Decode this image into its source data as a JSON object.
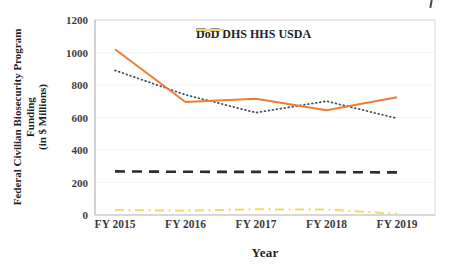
{
  "page": {
    "background": "#ffffff"
  },
  "chart_data": {
    "type": "line",
    "title": "",
    "xlabel": "Year",
    "ylabel": "Federal Civilian Biosecurity Program Funding (in $ Millions)",
    "ylabel_lines": [
      "Federal Civilian Biosecurity Program",
      "Funding",
      "(in $ Millions)"
    ],
    "categories": [
      "FY 2015",
      "FY 2016",
      "FY 2017",
      "FY 2018",
      "FY 2019"
    ],
    "ylim": [
      0,
      1200
    ],
    "yticks": [
      0,
      200,
      400,
      600,
      800,
      1000,
      1200
    ],
    "grid": "faint-horizontal",
    "legend_position": "top-center-inside",
    "axis_color": "#c2c2c2",
    "border_color": "#dadada",
    "gridline_color": "#f3f3f3",
    "series": [
      {
        "name": "HHS",
        "values": [
          268,
          266,
          265,
          264,
          262
        ],
        "color": "#2b2b2b",
        "style": "dashed"
      },
      {
        "name": "USDA",
        "values": [
          30,
          27,
          35,
          33,
          8
        ],
        "color": "#f0db62",
        "style": "dashdot"
      },
      {
        "name": "DoD",
        "values": [
          890,
          740,
          630,
          700,
          595
        ],
        "color": "#4a5160",
        "style": "dotted"
      },
      {
        "name": "DHS",
        "values": [
          1020,
          695,
          715,
          645,
          725
        ],
        "color": "#ed7d31",
        "style": "solid"
      }
    ],
    "legend_order": [
      "DoD",
      "DHS",
      "HHS",
      "USDA"
    ]
  }
}
